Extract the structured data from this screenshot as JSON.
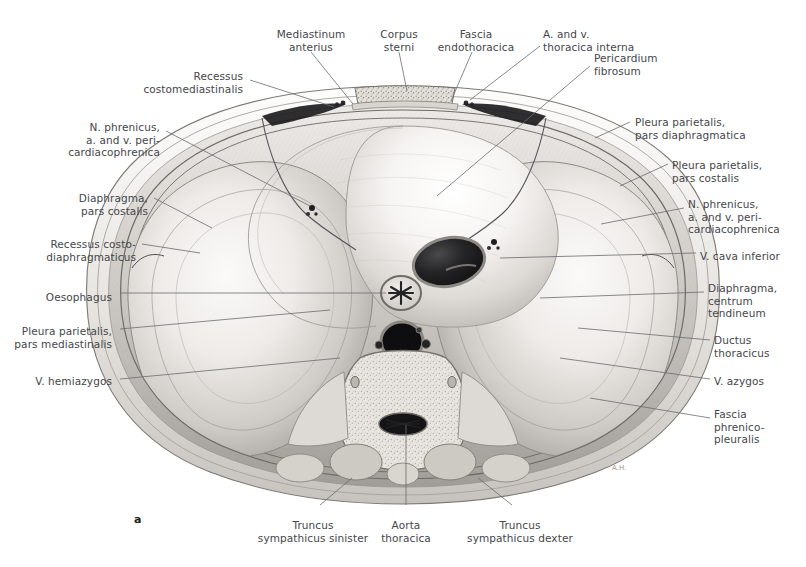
{
  "figure": {
    "panel_label": "a",
    "title_visible": false,
    "modality": "anatomical-illustration-grayscale"
  },
  "labels": [
    {
      "id": "recessus-costomediastinalis",
      "text": "Recessus\ncostomediastinalis",
      "align": "right",
      "x": 243,
      "y": 70
    },
    {
      "id": "mediastinum-anterius",
      "text": "Mediastinum\nanterius",
      "align": "center",
      "x": 311,
      "y": 28
    },
    {
      "id": "corpus-sterni",
      "text": "Corpus\nsterni",
      "align": "center",
      "x": 399,
      "y": 28
    },
    {
      "id": "fascia-endothoracica",
      "text": "Fascia\nendothoracica",
      "align": "center",
      "x": 476,
      "y": 28
    },
    {
      "id": "a-and-v-thoracica-interna",
      "text": "A. and v.\nthoracica interna",
      "align": "left",
      "x": 543,
      "y": 28
    },
    {
      "id": "pericardium-fibrosum",
      "text": "Pericardium\nfibrosum",
      "align": "left",
      "x": 594,
      "y": 52
    },
    {
      "id": "pleura-parietalis-pars-diaphragmatica",
      "text": "Pleura parietalis,\npars diaphragmatica",
      "align": "left",
      "x": 635,
      "y": 116
    },
    {
      "id": "pleura-parietalis-pars-costalis",
      "text": "Pleura parietalis,\npars costalis",
      "align": "left",
      "x": 672,
      "y": 159
    },
    {
      "id": "n-phrenicus-right",
      "text": "N. phrenicus,\na. and v. peri-\ncardiacophrenica",
      "align": "left",
      "x": 688,
      "y": 198
    },
    {
      "id": "v-cava-inferior",
      "text": "V. cava inferior",
      "align": "left",
      "x": 700,
      "y": 250
    },
    {
      "id": "diaphragma-centrum-tendineum",
      "text": "Diaphragma,\ncentrum\ntendineum",
      "align": "left",
      "x": 708,
      "y": 282
    },
    {
      "id": "ductus-thoracicus",
      "text": "Ductus\nthoracicus",
      "align": "left",
      "x": 714,
      "y": 334
    },
    {
      "id": "v-azygos",
      "text": "V. azygos",
      "align": "left",
      "x": 714,
      "y": 375
    },
    {
      "id": "fascia-phrenicopleuralis",
      "text": "Fascia\nphrenico-\npleuralis",
      "align": "left",
      "x": 714,
      "y": 408
    },
    {
      "id": "n-phrenicus-left",
      "text": "N. phrenicus,\na. and v. peri-\ncardiacophrenica",
      "align": "right",
      "x": 160,
      "y": 121
    },
    {
      "id": "diaphragma-pars-costalis",
      "text": "Diaphragma,\npars costalis",
      "align": "right",
      "x": 148,
      "y": 192
    },
    {
      "id": "recessus-costodiaphragmaticus",
      "text": "Recessus costo-\ndiaphragmaticus",
      "align": "right",
      "x": 136,
      "y": 238
    },
    {
      "id": "oesophagus",
      "text": "Oesophagus",
      "align": "right",
      "x": 112,
      "y": 291
    },
    {
      "id": "pleura-parietalis-pars-mediastinalis",
      "text": "Pleura parietalis,\npars mediastinalis",
      "align": "right",
      "x": 112,
      "y": 325
    },
    {
      "id": "v-hemiazygos",
      "text": "V. hemiazygos",
      "align": "right",
      "x": 112,
      "y": 375
    },
    {
      "id": "truncus-sympathicus-sinister",
      "text": "Truncus\nsympathicus sinister",
      "align": "center",
      "x": 313,
      "y": 519
    },
    {
      "id": "aorta-thoracica",
      "text": "Aorta\nthoracica",
      "align": "center",
      "x": 406,
      "y": 519
    },
    {
      "id": "truncus-sympathicus-dexter",
      "text": "Truncus\nsympathicus dexter",
      "align": "center",
      "x": 520,
      "y": 519
    }
  ],
  "leader_lines": [
    {
      "id": "leader-recessus-costomediastinalis",
      "points": "250,80 334,107"
    },
    {
      "id": "leader-mediastinum-anterius",
      "points": "311,52 353,104"
    },
    {
      "id": "leader-corpus-sterni",
      "points": "399,52 407,91"
    },
    {
      "id": "leader-fascia-endothoracica",
      "points": "472,52 451,101"
    },
    {
      "id": "leader-a-v-thoracica-interna",
      "points": "540,46 470,100"
    },
    {
      "id": "leader-pericardium-fibrosum",
      "points": "590,66 437,196"
    },
    {
      "id": "leader-pleura-diaphragmatica",
      "points": "630,122 595,138"
    },
    {
      "id": "leader-pleura-costalis",
      "points": "668,164 620,186"
    },
    {
      "id": "leader-n-phrenicus-right",
      "points": "684,208 601,224"
    },
    {
      "id": "leader-v-cava-inferior",
      "points": "696,253 500,258"
    },
    {
      "id": "leader-diaphragma-centrum",
      "points": "704,292 540,298"
    },
    {
      "id": "leader-ductus-thoracicus",
      "points": "710,340 578,328"
    },
    {
      "id": "leader-v-azygos",
      "points": "710,379 560,358"
    },
    {
      "id": "leader-fascia-phrenicopleuralis",
      "points": "710,418 590,398"
    },
    {
      "id": "leader-n-phrenicus-left",
      "points": "166,131 310,206"
    },
    {
      "id": "leader-diaphragma-pars-costalis",
      "points": "154,198 212,228"
    },
    {
      "id": "leader-recessus-costodiaphragmaticus",
      "points": "142,244 200,253"
    },
    {
      "id": "leader-oesophagus",
      "points": "120,293 386,293"
    },
    {
      "id": "leader-pleura-mediastinalis",
      "points": "120,329 330,310"
    },
    {
      "id": "leader-v-hemiazygos",
      "points": "120,379 340,358"
    },
    {
      "id": "leader-truncus-sinister",
      "points": "320,505 352,478"
    },
    {
      "id": "leader-aorta-thoracica",
      "points": "406,505 406,425"
    },
    {
      "id": "leader-truncus-dexter",
      "points": "512,505 478,478"
    }
  ],
  "colors": {
    "label_text": "#45464a",
    "leader_line": "#6b6c70",
    "background": "#ffffff",
    "tissue_light": "#f2f0ee",
    "tissue_mid": "#bdbab6",
    "tissue_dark": "#8c8985",
    "lumen_dark": "#1e1e20",
    "bone_speckle": "#cfccc7"
  }
}
